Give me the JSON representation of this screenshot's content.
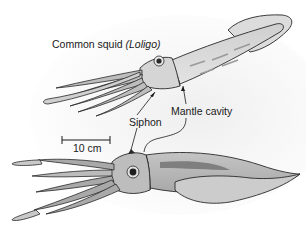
{
  "figure": {
    "title_prefix": "Common squid ",
    "title_genus": "(Loligo)",
    "labels": {
      "mantle_cavity": "Mantle cavity",
      "siphon": "Siphon"
    },
    "scale_bar": {
      "label": "10 cm"
    },
    "colors": {
      "background": "#ffffff",
      "background_shadow": "#f3f3f3",
      "body_light": "#d9d9d9",
      "body_mid": "#b5b5b5",
      "body_dark": "#8a8a8a",
      "outline": "#2a2a2a"
    }
  }
}
